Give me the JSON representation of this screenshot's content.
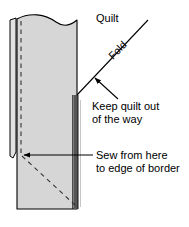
{
  "figure": {
    "labels": {
      "quilt": "Quilt",
      "fold": "Fold",
      "keep_quilt_line1": "Keep quilt out",
      "keep_quilt_line2": "of the way",
      "sew_line1": "Sew from here",
      "sew_line2": "to edge of border"
    },
    "colors": {
      "background": "#ffffff",
      "outline": "#000000",
      "fabric_fill": "#d6d6d6",
      "fabric_fill_light": "#e2e2e2",
      "border_band_dark": "#555555",
      "dashed_stitch": "#333333"
    },
    "geometry": {
      "border_strip_left_x": 10,
      "border_strip_right_x": 78,
      "panel_top_y": 16,
      "panel_bottom_y": 210,
      "vertical_dash_x": 21,
      "fold_meet_point": [
        77,
        95
      ],
      "sew_point": [
        22,
        155
      ],
      "mitre_diagonal_end": [
        76,
        205
      ]
    },
    "icons": {
      "arrow_keep_quilt": "arrow-up-left-icon",
      "arrow_sew": "arrow-left-icon"
    }
  }
}
